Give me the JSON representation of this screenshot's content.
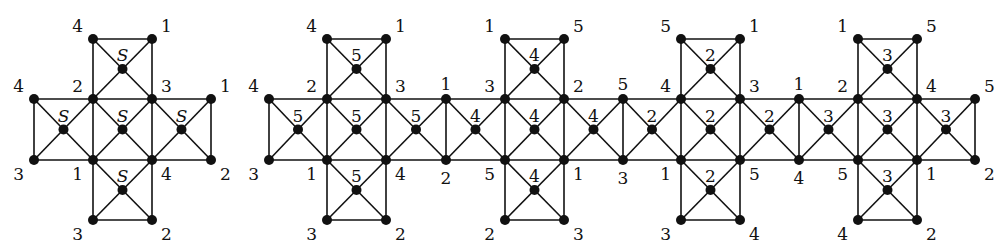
{
  "caption_fragment": "(·) … graph … p… p…",
  "graph_left": {
    "name": "cross-graph-S",
    "cols": [
      34,
      93,
      152,
      211
    ],
    "rows": [
      39,
      99,
      160,
      220
    ],
    "cells": [
      {
        "c": 1,
        "r": 0,
        "center_label": "S"
      },
      {
        "c": 0,
        "r": 1,
        "center_label": "S"
      },
      {
        "c": 1,
        "r": 1,
        "center_label": "S"
      },
      {
        "c": 2,
        "r": 1,
        "center_label": "S"
      },
      {
        "c": 1,
        "r": 2,
        "center_label": "S"
      }
    ],
    "corner_labels": [
      {
        "c": 1,
        "r": 0,
        "text": "4",
        "pos": "tl"
      },
      {
        "c": 2,
        "r": 0,
        "text": "1",
        "pos": "tr"
      },
      {
        "c": 0,
        "r": 1,
        "text": "4",
        "pos": "tl"
      },
      {
        "c": 1,
        "r": 1,
        "text": "2",
        "pos": "tl"
      },
      {
        "c": 2,
        "r": 1,
        "text": "3",
        "pos": "tr"
      },
      {
        "c": 3,
        "r": 1,
        "text": "1",
        "pos": "tr"
      },
      {
        "c": 0,
        "r": 2,
        "text": "3",
        "pos": "bl"
      },
      {
        "c": 1,
        "r": 2,
        "text": "1",
        "pos": "bl"
      },
      {
        "c": 2,
        "r": 2,
        "text": "4",
        "pos": "br"
      },
      {
        "c": 3,
        "r": 2,
        "text": "2",
        "pos": "br"
      },
      {
        "c": 1,
        "r": 3,
        "text": "3",
        "pos": "bl"
      },
      {
        "c": 2,
        "r": 3,
        "text": "2",
        "pos": "br"
      }
    ]
  },
  "graph_right": {
    "name": "strip-graph-numbered",
    "cols": [
      269,
      327,
      386,
      446,
      505,
      564,
      623,
      681,
      740,
      799,
      858,
      917,
      975
    ],
    "rows": [
      39,
      99,
      160,
      220
    ],
    "cells": [
      {
        "c": 0,
        "r": 1,
        "center_label": "5"
      },
      {
        "c": 1,
        "r": 1,
        "center_label": "5"
      },
      {
        "c": 2,
        "r": 1,
        "center_label": "5"
      },
      {
        "c": 3,
        "r": 1,
        "center_label": "4"
      },
      {
        "c": 4,
        "r": 1,
        "center_label": "4"
      },
      {
        "c": 5,
        "r": 1,
        "center_label": "4"
      },
      {
        "c": 6,
        "r": 1,
        "center_label": "2"
      },
      {
        "c": 7,
        "r": 1,
        "center_label": "2"
      },
      {
        "c": 8,
        "r": 1,
        "center_label": "2"
      },
      {
        "c": 9,
        "r": 1,
        "center_label": "3"
      },
      {
        "c": 10,
        "r": 1,
        "center_label": "3"
      },
      {
        "c": 11,
        "r": 1,
        "center_label": "3"
      },
      {
        "c": 1,
        "r": 0,
        "center_label": "5"
      },
      {
        "c": 1,
        "r": 2,
        "center_label": "5"
      },
      {
        "c": 4,
        "r": 0,
        "center_label": "4"
      },
      {
        "c": 4,
        "r": 2,
        "center_label": "4"
      },
      {
        "c": 7,
        "r": 0,
        "center_label": "2"
      },
      {
        "c": 7,
        "r": 2,
        "center_label": "2"
      },
      {
        "c": 10,
        "r": 0,
        "center_label": "3"
      },
      {
        "c": 10,
        "r": 2,
        "center_label": "3"
      }
    ],
    "corner_labels": [
      {
        "c": 1,
        "r": 0,
        "text": "4",
        "pos": "tl"
      },
      {
        "c": 2,
        "r": 0,
        "text": "1",
        "pos": "tr"
      },
      {
        "c": 4,
        "r": 0,
        "text": "1",
        "pos": "tl"
      },
      {
        "c": 5,
        "r": 0,
        "text": "5",
        "pos": "tr"
      },
      {
        "c": 7,
        "r": 0,
        "text": "5",
        "pos": "tl"
      },
      {
        "c": 8,
        "r": 0,
        "text": "1",
        "pos": "tr"
      },
      {
        "c": 10,
        "r": 0,
        "text": "1",
        "pos": "tl"
      },
      {
        "c": 11,
        "r": 0,
        "text": "5",
        "pos": "tr"
      },
      {
        "c": 0,
        "r": 1,
        "text": "4",
        "pos": "tl"
      },
      {
        "c": 1,
        "r": 1,
        "text": "2",
        "pos": "tl"
      },
      {
        "c": 2,
        "r": 1,
        "text": "3",
        "pos": "tr"
      },
      {
        "c": 3,
        "r": 1,
        "text": "1",
        "pos": "t"
      },
      {
        "c": 4,
        "r": 1,
        "text": "3",
        "pos": "tl"
      },
      {
        "c": 5,
        "r": 1,
        "text": "2",
        "pos": "tr"
      },
      {
        "c": 6,
        "r": 1,
        "text": "5",
        "pos": "t"
      },
      {
        "c": 7,
        "r": 1,
        "text": "4",
        "pos": "tl"
      },
      {
        "c": 8,
        "r": 1,
        "text": "3",
        "pos": "tr"
      },
      {
        "c": 9,
        "r": 1,
        "text": "1",
        "pos": "t"
      },
      {
        "c": 10,
        "r": 1,
        "text": "2",
        "pos": "tl"
      },
      {
        "c": 11,
        "r": 1,
        "text": "4",
        "pos": "tr"
      },
      {
        "c": 12,
        "r": 1,
        "text": "5",
        "pos": "tr"
      },
      {
        "c": 0,
        "r": 2,
        "text": "3",
        "pos": "bl"
      },
      {
        "c": 1,
        "r": 2,
        "text": "1",
        "pos": "bl"
      },
      {
        "c": 2,
        "r": 2,
        "text": "4",
        "pos": "br"
      },
      {
        "c": 3,
        "r": 2,
        "text": "2",
        "pos": "b"
      },
      {
        "c": 4,
        "r": 2,
        "text": "5",
        "pos": "bl"
      },
      {
        "c": 5,
        "r": 2,
        "text": "1",
        "pos": "br"
      },
      {
        "c": 6,
        "r": 2,
        "text": "3",
        "pos": "b"
      },
      {
        "c": 7,
        "r": 2,
        "text": "1",
        "pos": "bl"
      },
      {
        "c": 8,
        "r": 2,
        "text": "5",
        "pos": "br"
      },
      {
        "c": 9,
        "r": 2,
        "text": "4",
        "pos": "b"
      },
      {
        "c": 10,
        "r": 2,
        "text": "5",
        "pos": "bl"
      },
      {
        "c": 11,
        "r": 2,
        "text": "1",
        "pos": "br"
      },
      {
        "c": 12,
        "r": 2,
        "text": "2",
        "pos": "br"
      },
      {
        "c": 1,
        "r": 3,
        "text": "3",
        "pos": "bl"
      },
      {
        "c": 2,
        "r": 3,
        "text": "2",
        "pos": "br"
      },
      {
        "c": 4,
        "r": 3,
        "text": "2",
        "pos": "bl"
      },
      {
        "c": 5,
        "r": 3,
        "text": "3",
        "pos": "br"
      },
      {
        "c": 7,
        "r": 3,
        "text": "3",
        "pos": "bl"
      },
      {
        "c": 8,
        "r": 3,
        "text": "4",
        "pos": "br"
      },
      {
        "c": 10,
        "r": 3,
        "text": "4",
        "pos": "bl"
      },
      {
        "c": 11,
        "r": 3,
        "text": "2",
        "pos": "br"
      }
    ]
  }
}
